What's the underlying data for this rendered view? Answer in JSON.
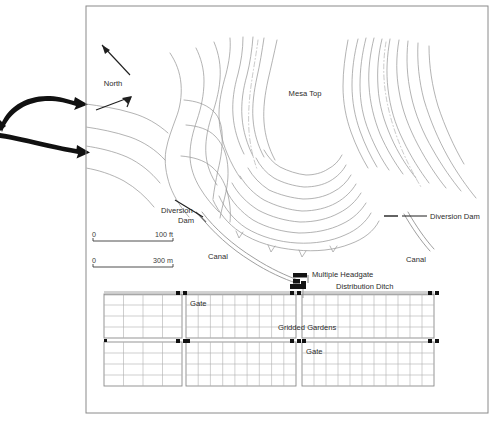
{
  "figure": {
    "type": "archaeological-site-map",
    "background_color": "#ffffff",
    "frame": {
      "name": "map-frame",
      "x": 86,
      "y": 6,
      "width": 402,
      "height": 407,
      "stroke": "#8a8a8a"
    },
    "colors": {
      "contour": "#9a9a9a",
      "drainage": "#b5b5b5",
      "canal": "#8e8e8e",
      "grid": "#a8a8a8",
      "block_outline": "#8a8a8a",
      "marker": "#1a1a1a",
      "text": "#2b2b2b",
      "arrow": "#111111",
      "frame": "#8a8a8a"
    },
    "labels": {
      "north": "North",
      "mesa_top": "Mesa Top",
      "diversion_dam_left_line1": "Diversion",
      "diversion_dam_left_line2": "Dam",
      "diversion_dam_right": "Diversion Dam",
      "canal_left": "Canal",
      "canal_right": "Canal",
      "multiple_headgate": "Multiple Headgate",
      "distribution_ditch": "Distribution Ditch",
      "gridded_gardens": "Gridded Gardens",
      "gate_upper": "Gate",
      "gate_lower": "Gate"
    },
    "scale_bars": [
      {
        "name": "scale-bar-feet",
        "zero": "0",
        "value": "100 ft",
        "y": 232
      },
      {
        "name": "scale-bar-meters",
        "zero": "0",
        "value": "300 m",
        "y": 258
      }
    ],
    "flow_arrows": {
      "count": 2,
      "description": "two thick curved inflow arrows entering from the left margin"
    },
    "garden_blocks": [
      {
        "name": "garden-block-west-upper",
        "x": 104,
        "y": 294,
        "width": 78,
        "height": 44,
        "cols": 4,
        "rows": 4
      },
      {
        "name": "garden-block-west-lower",
        "x": 104,
        "y": 342,
        "width": 78,
        "height": 44,
        "cols": 4,
        "rows": 4
      },
      {
        "name": "garden-block-center-upper",
        "x": 186,
        "y": 294,
        "width": 110,
        "height": 44,
        "cols": 9,
        "rows": 4
      },
      {
        "name": "garden-block-center-lower",
        "x": 186,
        "y": 342,
        "width": 110,
        "height": 44,
        "cols": 9,
        "rows": 4
      },
      {
        "name": "garden-block-east-upper",
        "x": 302,
        "y": 294,
        "width": 132,
        "height": 44,
        "cols": 11,
        "rows": 4
      },
      {
        "name": "garden-block-east-lower",
        "x": 302,
        "y": 342,
        "width": 132,
        "height": 44,
        "cols": 11,
        "rows": 4
      }
    ]
  }
}
